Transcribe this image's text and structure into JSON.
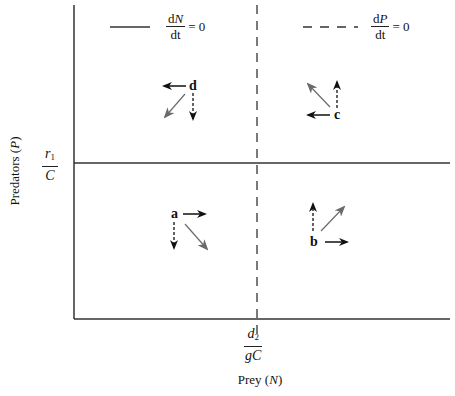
{
  "diagram": {
    "title": "",
    "axes": {
      "y_label_text": "Predators",
      "y_label_var": "P",
      "x_label_text": "Prey",
      "x_label_var": "N"
    },
    "thresholds": {
      "y_num_base": "r",
      "y_num_sub": "1",
      "y_den": "C",
      "x_num_base": "d",
      "x_num_sub": "2",
      "x_den": "gC"
    },
    "legend": [
      {
        "style": "solid",
        "num_d": "d",
        "num_var": "N",
        "den": "dt",
        "rest": "= 0"
      },
      {
        "style": "dashed",
        "num_d": "d",
        "num_var": "P",
        "den": "dt",
        "rest": "= 0"
      }
    ],
    "regions": [
      {
        "label": "a",
        "prey_arrow": "right",
        "predator_arrow": "down",
        "resultant": "down-right"
      },
      {
        "label": "b",
        "prey_arrow": "right",
        "predator_arrow": "up",
        "resultant": "up-right"
      },
      {
        "label": "c",
        "prey_arrow": "left",
        "predator_arrow": "up",
        "resultant": "up-left"
      },
      {
        "label": "d",
        "prey_arrow": "left",
        "predator_arrow": "down",
        "resultant": "down-left"
      }
    ],
    "colors": {
      "line": "#222222",
      "resultant_arrow": "#6a6a6a",
      "background": "#ffffff"
    }
  }
}
